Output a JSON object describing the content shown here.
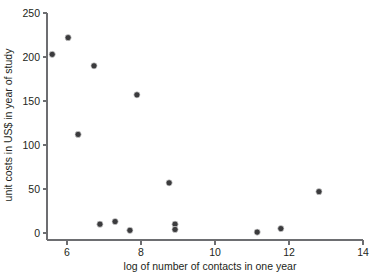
{
  "chart_data": {
    "type": "scatter",
    "title": "",
    "xlabel": "log of number of contacts in one year",
    "ylabel": "unit costs in US$ in year of study",
    "xlim": [
      5.4,
      14.0
    ],
    "ylim": [
      0,
      250
    ],
    "xticks": [
      6,
      8,
      10,
      12,
      14
    ],
    "yticks": [
      0,
      50,
      100,
      150,
      200,
      250
    ],
    "xtick_labels": [
      "6",
      "8",
      "10",
      "12",
      "14"
    ],
    "ytick_labels": [
      "0",
      "50",
      "100",
      "150",
      "200",
      "250"
    ],
    "grid": false,
    "legend": null,
    "marker": "filled-circle",
    "marker_color": "#3b3b3d",
    "axis_color": "#6d6e71",
    "points": [
      {
        "x": 5.6,
        "y": 203
      },
      {
        "x": 6.03,
        "y": 222
      },
      {
        "x": 6.3,
        "y": 112
      },
      {
        "x": 6.73,
        "y": 190
      },
      {
        "x": 6.89,
        "y": 10
      },
      {
        "x": 7.3,
        "y": 13
      },
      {
        "x": 7.7,
        "y": 3
      },
      {
        "x": 7.89,
        "y": 157
      },
      {
        "x": 8.76,
        "y": 57
      },
      {
        "x": 8.92,
        "y": 10
      },
      {
        "x": 8.92,
        "y": 4
      },
      {
        "x": 11.14,
        "y": 1
      },
      {
        "x": 11.78,
        "y": 5
      },
      {
        "x": 12.81,
        "y": 47
      }
    ]
  },
  "axes": {
    "x_axis_name": "x-axis",
    "y_axis_name": "y-axis"
  }
}
